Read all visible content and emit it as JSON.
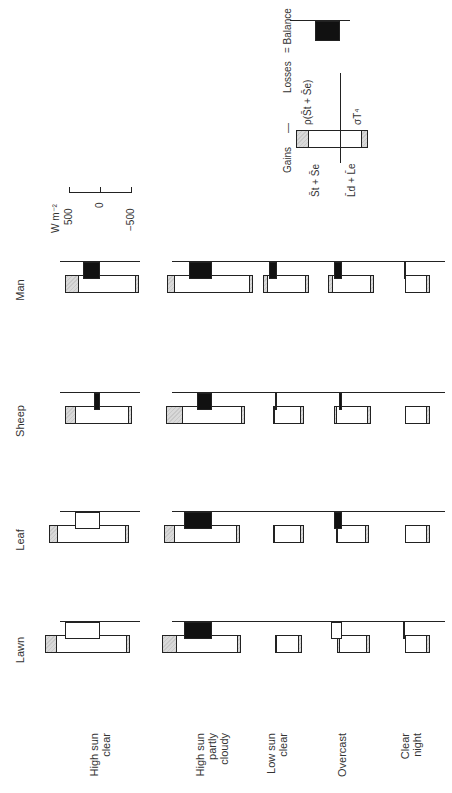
{
  "figure": {
    "unit_label": "W m⁻²",
    "scale": {
      "top": "500",
      "mid": "0",
      "bottom": "−500"
    },
    "species": [
      "Lawn",
      "Leaf",
      "Sheep",
      "Man"
    ],
    "conditions": [
      "High sun clear",
      "High sun partly cloudy",
      "Low sun clear",
      "Overcast",
      "Clear night"
    ],
    "condition_lines": [
      [
        "High sun",
        "clear"
      ],
      [
        "High sun",
        "partly",
        "cloudy"
      ],
      [
        "Low sun",
        "clear"
      ],
      [
        "Overcast"
      ],
      [
        "Clear night"
      ]
    ],
    "legend": {
      "gains": "Gains",
      "minus": "—",
      "losses": "Losses",
      "equals": "= Balance",
      "gain_short": "S̄t + S̄e",
      "gain_long": "L̄d + L̄e",
      "loss_reflected": "ρ(S̄t + S̄e)",
      "loss_emitted": "σT⁴"
    }
  },
  "chart_data": {
    "type": "bar",
    "title": "",
    "xlabel": "",
    "ylabel": "W m-2",
    "ylim": [
      -500,
      500
    ],
    "grid": false,
    "categories": [
      "High sun clear",
      "High sun partly cloudy",
      "Low sun clear",
      "Overcast",
      "Clear night"
    ],
    "panels": [
      "Lawn",
      "Leaf",
      "Sheep",
      "Man"
    ],
    "legend": [
      "Gains: S_t + S_e (shortwave)",
      "Gains: L_d + L_e (longwave)",
      "Losses: rho(S_t + S_e) (reflected)",
      "Losses: sigma T^4 (emitted)",
      "Balance"
    ],
    "series": [
      {
        "name": "Lawn",
        "shortwave_gain": [
          890,
          800,
          30,
          80,
          0
        ],
        "longwave_gain": [
          480,
          460,
          400,
          450,
          400
        ],
        "reflected_loss": [
          200,
          230,
          20,
          40,
          0
        ],
        "emitted_loss": [
          560,
          680,
          430,
          440,
          400
        ],
        "balance": [
          560,
          450,
          0,
          180,
          30
        ],
        "balance_sign": [
          "positive-open",
          "negative-solid",
          "zero",
          "positive-open",
          "negative-solid"
        ]
      },
      {
        "name": "Leaf",
        "shortwave_gain": [
          830,
          780,
          60,
          100,
          0
        ],
        "longwave_gain": [
          460,
          450,
          430,
          440,
          400
        ],
        "reflected_loss": [
          160,
          180,
          20,
          30,
          0
        ],
        "emitted_loss": [
          590,
          700,
          440,
          460,
          400
        ],
        "balance": [
          410,
          450,
          0,
          130,
          0
        ],
        "balance_sign": [
          "positive-open",
          "negative-solid",
          "zero",
          "negative-solid",
          "zero"
        ]
      },
      {
        "name": "Sheep",
        "shortwave_gain": [
          560,
          740,
          60,
          130,
          0
        ],
        "longwave_gain": [
          520,
          540,
          430,
          470,
          410
        ],
        "reflected_loss": [
          170,
          270,
          20,
          50,
          0
        ],
        "emitted_loss": [
          720,
          780,
          480,
          520,
          430
        ],
        "balance": [
          100,
          250,
          30,
          50,
          0
        ],
        "balance_sign": [
          "negative-solid",
          "negative-solid",
          "negative-solid",
          "negative-solid",
          "zero"
        ]
      },
      {
        "name": "Man",
        "shortwave_gain": [
          560,
          720,
          220,
          230,
          0
        ],
        "longwave_gain": [
          630,
          660,
          520,
          520,
          410
        ],
        "reflected_loss": [
          220,
          120,
          80,
          80,
          0
        ],
        "emitted_loss": [
          710,
          880,
          560,
          610,
          420
        ],
        "balance": [
          270,
          370,
          130,
          130,
          20
        ],
        "balance_sign": [
          "negative-solid",
          "negative-solid",
          "negative-solid",
          "negative-solid",
          "negative-solid"
        ]
      }
    ]
  }
}
